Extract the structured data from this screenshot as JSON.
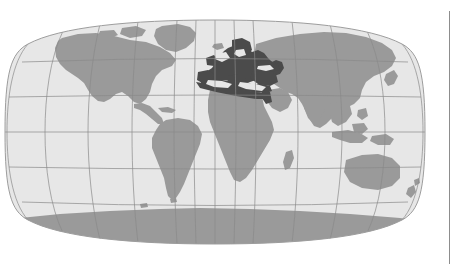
{
  "figure": {
    "kind": "world-map",
    "projection": "Robinson",
    "caption": "",
    "alt_text": "World map in Robinson projection with Europe and the Mediterranean basin highlighted in dark grey"
  },
  "map": {
    "title": "",
    "ocean_color": "#e7e7e7",
    "land_color": "#9a9a9a",
    "highlight_color": "#4b4b4b",
    "graticule_color": "#8a8a8a",
    "outline_color": "#9d9d9d",
    "antarctica_color": "#9a9a9a",
    "highlighted_region_label": "Europe and Mediterranean",
    "regions": [
      {
        "name": "North America",
        "state": "land"
      },
      {
        "name": "South America",
        "state": "land"
      },
      {
        "name": "Greenland",
        "state": "land"
      },
      {
        "name": "Africa",
        "state": "land"
      },
      {
        "name": "Europe",
        "state": "highlighted"
      },
      {
        "name": "Mediterranean Basin",
        "state": "highlighted"
      },
      {
        "name": "Asia",
        "state": "land"
      },
      {
        "name": "Australia",
        "state": "land"
      },
      {
        "name": "Antarctica",
        "state": "land"
      }
    ],
    "graticule": {
      "meridian_interval_degrees": 30,
      "parallel_interval_degrees": 30,
      "meridians": [
        -180,
        -150,
        -120,
        -90,
        -60,
        -30,
        0,
        30,
        60,
        90,
        120,
        150,
        180
      ],
      "parallels": [
        -60,
        -30,
        0,
        30,
        60
      ],
      "equator_label": "0",
      "shown": true
    },
    "legend": {
      "shown": false,
      "entries": []
    }
  },
  "divider": {
    "name": "right-vertical-rule",
    "color": "#8d8d8d"
  }
}
